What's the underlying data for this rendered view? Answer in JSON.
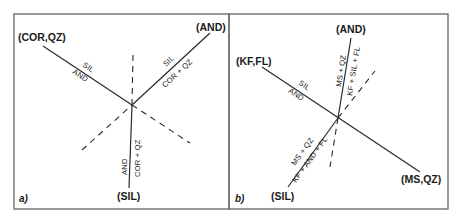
{
  "panel_a": {
    "label": "a)",
    "endpoints": {
      "cor_qz": "(COR,QZ)",
      "and": "(AND)",
      "sil": "(SIL)"
    },
    "reactions": {
      "left_upper": "SIL",
      "left_lower": "AND",
      "right_upper": "SIL",
      "right_lower": "COR + QZ",
      "bottom_left": "AND",
      "bottom_right": "COR + QZ"
    }
  },
  "panel_b": {
    "label": "b)",
    "endpoints": {
      "kf_fl": "(KF,FL)",
      "and": "(AND)",
      "sil": "(SIL)",
      "ms_qz": "(MS,QZ)"
    },
    "reactions": {
      "left_upper": "SIL",
      "left_lower": "AND",
      "top_left": "MS + QZ",
      "top_right": "KF + SIL + FL",
      "bottom_upper": "MS + QZ",
      "bottom_lower": "KF + AND + FL"
    }
  },
  "colors": {
    "line": "#2a2a2a",
    "frame": "#6f6f6f",
    "text": "#1a1a1a"
  }
}
